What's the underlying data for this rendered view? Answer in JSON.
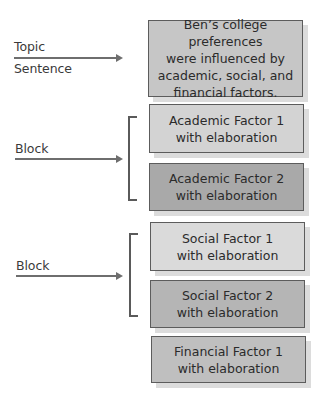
{
  "diagram": {
    "type": "paragraph-structure-outline",
    "labels": {
      "topic": "Topic\nSentence",
      "topic_line1": "Topic",
      "topic_line2": "Sentence",
      "block1": "Block",
      "block2": "Block"
    },
    "boxes": [
      {
        "id": "topic-sentence",
        "text": "Ben’s college preferences\nwere influenced by\nacademic, social, and\nfinancial factors.",
        "fill": "#c6c6c6"
      },
      {
        "id": "academic-1",
        "text": "Academic Factor 1\nwith elaboration",
        "fill": "#d3d3d3"
      },
      {
        "id": "academic-2",
        "text": "Academic Factor 2\nwith elaboration",
        "fill": "#a9a9a9"
      },
      {
        "id": "social-1",
        "text": "Social Factor 1\nwith elaboration",
        "fill": "#dadada"
      },
      {
        "id": "social-2",
        "text": "Social Factor 2\nwith elaboration",
        "fill": "#b5b5b5"
      },
      {
        "id": "financial-1",
        "text": "Financial Factor 1\nwith elaboration",
        "fill": "#bfbfbf"
      }
    ],
    "colors": {
      "border": "#5c5c5c",
      "arrow": "#6e6e6e",
      "bracket": "#5a5a5a",
      "shadow": "#dcdcdc"
    }
  }
}
